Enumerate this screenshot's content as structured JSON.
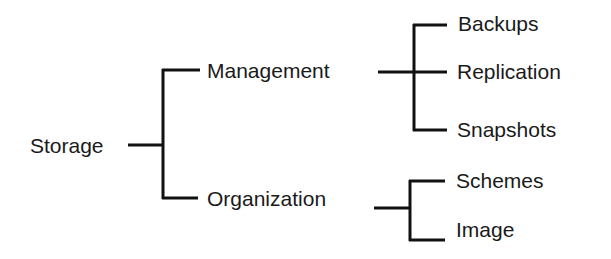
{
  "diagram": {
    "type": "tree",
    "orientation": "left-to-right",
    "colors": {
      "line": "#111111",
      "text": "#1a1a1a",
      "background": "#ffffff"
    },
    "root": {
      "label": "Storage",
      "children": [
        {
          "label": "Management",
          "children": [
            {
              "label": "Backups"
            },
            {
              "label": "Replication"
            },
            {
              "label": "Snapshots"
            }
          ]
        },
        {
          "label": "Organization",
          "children": [
            {
              "label": "Schemes"
            },
            {
              "label": "Image"
            }
          ]
        }
      ]
    }
  }
}
